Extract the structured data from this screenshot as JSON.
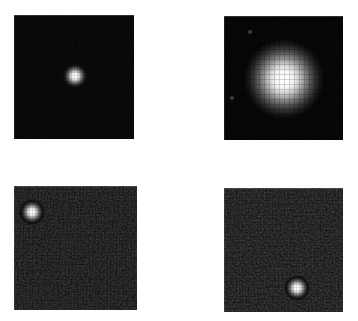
{
  "figure": {
    "title": "",
    "background_color": "#ffffff",
    "width": 358,
    "height": 321,
    "layout": "2x2-grid",
    "panel_count": 4
  },
  "chart_data": {
    "type": "heatmap",
    "title": "",
    "subtitle": "",
    "xlabel": "",
    "ylabel": "",
    "grid": false,
    "legend": "none",
    "colormap": "grayscale",
    "panels": [
      {
        "id": "panel-top-left",
        "label": "",
        "row": 0,
        "col": 0,
        "x": 14,
        "y": 15,
        "width": 120,
        "height": 124,
        "background_color": "#030303",
        "noise_level": "low",
        "sources": [
          {
            "name": "point-source-a",
            "cx": 61,
            "cy": 61,
            "radius": 13,
            "peak_brightness": 255,
            "profile": "compact"
          }
        ]
      },
      {
        "id": "panel-top-right",
        "label": "",
        "row": 0,
        "col": 1,
        "x": 224,
        "y": 16,
        "width": 119,
        "height": 124,
        "background_color": "#020202",
        "noise_level": "low",
        "sources": [
          {
            "name": "point-source-b",
            "cx": 60,
            "cy": 63,
            "radius": 40,
            "peak_brightness": 255,
            "profile": "broad-saturated"
          },
          {
            "name": "faint-source-b2",
            "cx": 26,
            "cy": 16,
            "radius": 3,
            "peak_brightness": 70,
            "profile": "faint"
          },
          {
            "name": "faint-source-b3",
            "cx": 8,
            "cy": 82,
            "radius": 3,
            "peak_brightness": 60,
            "profile": "faint"
          }
        ]
      },
      {
        "id": "panel-bottom-left",
        "label": "",
        "row": 1,
        "col": 0,
        "x": 14,
        "y": 186,
        "width": 123,
        "height": 124,
        "background_color": "#0a0a0a",
        "noise_level": "high",
        "sources": [
          {
            "name": "point-source-c",
            "cx": 18,
            "cy": 26,
            "radius": 13,
            "peak_brightness": 250,
            "profile": "compact"
          }
        ]
      },
      {
        "id": "panel-bottom-right",
        "label": "",
        "row": 1,
        "col": 1,
        "x": 224,
        "y": 188,
        "width": 119,
        "height": 124,
        "background_color": "#0a0a0a",
        "noise_level": "high",
        "sources": [
          {
            "name": "point-source-d",
            "cx": 73,
            "cy": 100,
            "radius": 13,
            "peak_brightness": 250,
            "profile": "compact"
          },
          {
            "name": "faint-source-d2",
            "cx": 109,
            "cy": 24,
            "radius": 3,
            "peak_brightness": 75,
            "profile": "faint"
          }
        ]
      }
    ]
  }
}
